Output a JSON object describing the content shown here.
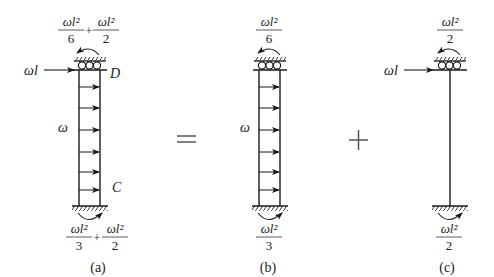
{
  "diagram": {
    "type": "structural-mechanics superposition",
    "operators": {
      "equals": "=",
      "plus": "+"
    },
    "panels": [
      {
        "id": "a",
        "caption": "(a)",
        "top_moment": {
          "terms": [
            {
              "num": "ωl²",
              "den": "6"
            },
            {
              "num": "ωl²",
              "den": "2"
            }
          ],
          "op": "+"
        },
        "bottom_moment": {
          "terms": [
            {
              "num": "ωl²",
              "den": "3"
            },
            {
              "num": "ωl²",
              "den": "2"
            }
          ],
          "op": "+"
        },
        "point_load": "ωl",
        "distributed_load": "ω",
        "top_node": "D",
        "bottom_node": "C"
      },
      {
        "id": "b",
        "caption": "(b)",
        "top_moment": {
          "terms": [
            {
              "num": "ωl²",
              "den": "6"
            }
          ]
        },
        "bottom_moment": {
          "terms": [
            {
              "num": "ωl²",
              "den": "3"
            }
          ]
        },
        "distributed_load": "ω"
      },
      {
        "id": "c",
        "caption": "(c)",
        "top_moment": {
          "terms": [
            {
              "num": "ωl²",
              "den": "2"
            }
          ]
        },
        "bottom_moment": {
          "terms": [
            {
              "num": "ωl²",
              "den": "2"
            }
          ]
        },
        "point_load": "ωl"
      }
    ]
  }
}
